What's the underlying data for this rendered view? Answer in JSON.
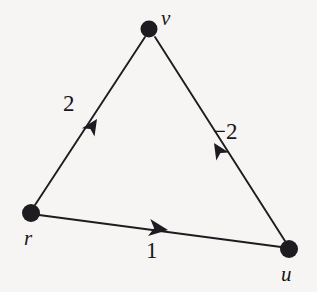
{
  "figure": {
    "kind": "directed-weighted-graph",
    "background_color": "#f6f5f3",
    "stroke_color": "#1d1c20",
    "node_fill_color": "#1d1c20",
    "width": 317,
    "height": 292
  },
  "nodes": [
    {
      "id": "v",
      "label": "v",
      "cx": 149,
      "cy": 29,
      "r": 8.5,
      "label_x": 161,
      "label_y": 8
    },
    {
      "id": "r",
      "label": "r",
      "cx": 31,
      "cy": 213,
      "r": 9.0,
      "label_x": 24,
      "label_y": 228
    },
    {
      "id": "u",
      "label": "u",
      "cx": 289,
      "cy": 249,
      "r": 9.0,
      "label_x": 281,
      "label_y": 264
    }
  ],
  "edges": [
    {
      "id": "r-to-v",
      "from": "r",
      "to": "v",
      "weight": "2",
      "label_x": 63,
      "label_y": 92,
      "arrow_x": 96,
      "arrow_y": 119
    },
    {
      "id": "u-to-v",
      "from": "u",
      "to": "v",
      "weight": "−2",
      "label_x": 213,
      "label_y": 120,
      "arrow_x": 215,
      "arrow_y": 142
    },
    {
      "id": "r-to-u",
      "from": "r",
      "to": "u",
      "weight": "1",
      "label_x": 146,
      "label_y": 239,
      "arrow_x": 153,
      "arrow_y": 228
    }
  ]
}
